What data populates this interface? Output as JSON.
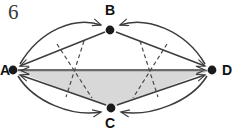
{
  "figure": {
    "number": "6",
    "type": "directed-graph",
    "width": 236,
    "height": 132,
    "background": "#ffffff",
    "stroke_color": "#3c3c3c",
    "fill_color": "#d8d8d8",
    "vertex_color": "#1a1a1a"
  },
  "vertices": [
    {
      "id": "A",
      "label": "A",
      "x": 13,
      "y": 70
    },
    {
      "id": "B",
      "label": "B",
      "x": 110,
      "y": 30
    },
    {
      "id": "C",
      "label": "C",
      "x": 111,
      "y": 108
    },
    {
      "id": "D",
      "label": "D",
      "x": 212,
      "y": 70
    }
  ],
  "shaded_region": {
    "name": "triangle-a-d-c",
    "points": "13,70 212,70 111,108",
    "fill": "#d8d8d8"
  },
  "edges": [
    {
      "from": "A",
      "to": "B",
      "style": "arc-outer-upper",
      "arrow": "B"
    },
    {
      "from": "D",
      "to": "B",
      "style": "arc-outer-upper",
      "arrow": "B"
    },
    {
      "from": "B",
      "to": "A",
      "style": "straight",
      "arrow": "A"
    },
    {
      "from": "B",
      "to": "D",
      "style": "straight",
      "arrow": "D"
    },
    {
      "from": "A",
      "to": "C",
      "style": "arc-outer-lower",
      "arrow": "C"
    },
    {
      "from": "D",
      "to": "C",
      "style": "arc-outer-lower",
      "arrow": "C"
    },
    {
      "from": "C",
      "to": "A",
      "style": "straight",
      "arrow": "A"
    },
    {
      "from": "C",
      "to": "D",
      "style": "straight",
      "arrow": "D"
    },
    {
      "from": "A",
      "to": "D",
      "style": "straight-horizontal",
      "arrow": "D"
    },
    {
      "from": "D",
      "to": "A",
      "style": "straight-horizontal",
      "arrow": "A"
    },
    {
      "from": "B",
      "to": "C",
      "style": "dashed-left",
      "arrow": "none"
    },
    {
      "from": "C",
      "to": "B",
      "style": "dashed-left",
      "arrow": "none"
    },
    {
      "from": "B",
      "to": "C",
      "style": "dashed-right",
      "arrow": "none"
    },
    {
      "from": "C",
      "to": "B",
      "style": "dashed-right",
      "arrow": "none"
    }
  ]
}
